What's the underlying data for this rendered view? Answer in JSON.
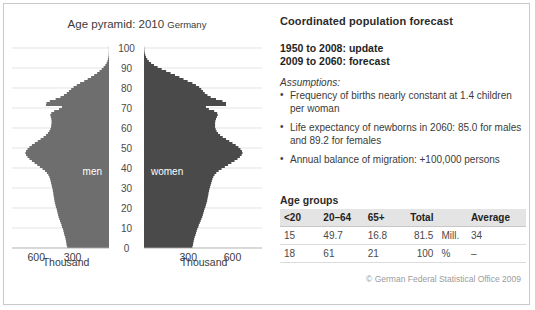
{
  "chart_data": {
    "type": "bar",
    "title": "Age pyramid: 2010",
    "title_suffix": "Germany",
    "orientation": "horizontal-population-pyramid",
    "xlabel": "Thousand",
    "ylabel": "Age",
    "xlim": [
      0,
      800
    ],
    "ylim": [
      0,
      100
    ],
    "x_ticks_left": [
      "600",
      "300"
    ],
    "x_ticks_right": [
      "300",
      "600"
    ],
    "y_ticks": [
      "0",
      "10",
      "20",
      "30",
      "40",
      "50",
      "60",
      "70",
      "80",
      "90",
      "100"
    ],
    "grid": true,
    "legend_position": "inline",
    "series": [
      {
        "name": "men",
        "label": "men",
        "side": "left",
        "color": "#6e6e6e",
        "ages": [
          0,
          1,
          2,
          3,
          4,
          5,
          6,
          7,
          8,
          9,
          10,
          11,
          12,
          13,
          14,
          15,
          16,
          17,
          18,
          19,
          20,
          21,
          22,
          23,
          24,
          25,
          26,
          27,
          28,
          29,
          30,
          31,
          32,
          33,
          34,
          35,
          36,
          37,
          38,
          39,
          40,
          41,
          42,
          43,
          44,
          45,
          46,
          47,
          48,
          49,
          50,
          51,
          52,
          53,
          54,
          55,
          56,
          57,
          58,
          59,
          60,
          61,
          62,
          63,
          64,
          65,
          66,
          67,
          68,
          69,
          70,
          71,
          72,
          73,
          74,
          75,
          76,
          77,
          78,
          79,
          80,
          81,
          82,
          83,
          84,
          85,
          86,
          87,
          88,
          89,
          90,
          91,
          92,
          93,
          94,
          95,
          96,
          97,
          98,
          99,
          100
        ],
        "values": [
          345,
          350,
          352,
          355,
          358,
          362,
          368,
          372,
          376,
          380,
          388,
          392,
          398,
          404,
          410,
          416,
          420,
          424,
          428,
          432,
          438,
          442,
          446,
          450,
          452,
          455,
          458,
          460,
          463,
          466,
          470,
          474,
          478,
          482,
          486,
          492,
          500,
          512,
          528,
          548,
          570,
          592,
          614,
          636,
          656,
          672,
          684,
          690,
          684,
          672,
          656,
          636,
          612,
          588,
          564,
          540,
          520,
          504,
          492,
          484,
          478,
          476,
          474,
          474,
          476,
          480,
          484,
          476,
          452,
          412,
          388,
          520,
          516,
          488,
          440,
          400,
          372,
          348,
          330,
          312,
          292,
          266,
          238,
          204,
          176,
          148,
          122,
          98,
          78,
          60,
          44,
          30,
          20,
          13,
          8,
          5,
          3,
          2,
          1,
          1,
          1
        ]
      },
      {
        "name": "women",
        "label": "women",
        "side": "right",
        "color": "#4a4a4a",
        "ages": [
          0,
          1,
          2,
          3,
          4,
          5,
          6,
          7,
          8,
          9,
          10,
          11,
          12,
          13,
          14,
          15,
          16,
          17,
          18,
          19,
          20,
          21,
          22,
          23,
          24,
          25,
          26,
          27,
          28,
          29,
          30,
          31,
          32,
          33,
          34,
          35,
          36,
          37,
          38,
          39,
          40,
          41,
          42,
          43,
          44,
          45,
          46,
          47,
          48,
          49,
          50,
          51,
          52,
          53,
          54,
          55,
          56,
          57,
          58,
          59,
          60,
          61,
          62,
          63,
          64,
          65,
          66,
          67,
          68,
          69,
          70,
          71,
          72,
          73,
          74,
          75,
          76,
          77,
          78,
          79,
          80,
          81,
          82,
          83,
          84,
          85,
          86,
          87,
          88,
          89,
          90,
          91,
          92,
          93,
          94,
          95,
          96,
          97,
          98,
          99,
          100
        ],
        "values": [
          328,
          332,
          334,
          337,
          340,
          344,
          349,
          353,
          357,
          361,
          368,
          372,
          378,
          384,
          389,
          395,
          399,
          403,
          407,
          411,
          416,
          420,
          424,
          428,
          430,
          433,
          436,
          438,
          441,
          444,
          448,
          452,
          456,
          460,
          464,
          470,
          478,
          490,
          506,
          526,
          548,
          570,
          592,
          614,
          634,
          650,
          662,
          668,
          664,
          654,
          640,
          622,
          600,
          578,
          556,
          534,
          516,
          502,
          492,
          486,
          482,
          482,
          482,
          484,
          488,
          494,
          500,
          496,
          476,
          440,
          420,
          556,
          556,
          532,
          488,
          452,
          430,
          412,
          400,
          388,
          374,
          352,
          328,
          296,
          268,
          240,
          210,
          180,
          150,
          120,
          92,
          68,
          48,
          33,
          22,
          14,
          9,
          5,
          3,
          2,
          1
        ]
      }
    ]
  },
  "pyramid": {
    "title": "Age pyramid: 2010",
    "title_suffix": "Germany",
    "unit_label": "Thousand",
    "left_label": "men",
    "right_label": "women"
  },
  "forecast": {
    "heading": "Coordinated population forecast",
    "period_update": "1950 to 2008: update",
    "period_forecast": "2009 to 2060: forecast",
    "assumptions_label": "Assumptions:",
    "assumptions": [
      "Frequency of births nearly constant at 1.4 children per woman",
      "Life expectancy of newborns in 2060: 85.0 for males and 89.2 for females",
      "Annual balance of migration: +100,000 persons"
    ]
  },
  "age_groups": {
    "caption": "Age groups",
    "headers": [
      "<20",
      "20–64",
      "65+",
      "Total",
      "",
      "Average"
    ],
    "rows": [
      [
        "15",
        "49.7",
        "16.8",
        "81.5",
        "Mill.",
        "34"
      ],
      [
        "18",
        "61",
        "21",
        "100",
        "%",
        "–"
      ]
    ]
  },
  "copyright": "© German Federal Statistical Office 2009",
  "colors": {
    "men": "#6e6e6e",
    "women": "#4a4a4a",
    "grid": "#d8d8d8",
    "frame": "#c9c9c9",
    "table_header_bg": "#e4e4e4"
  }
}
